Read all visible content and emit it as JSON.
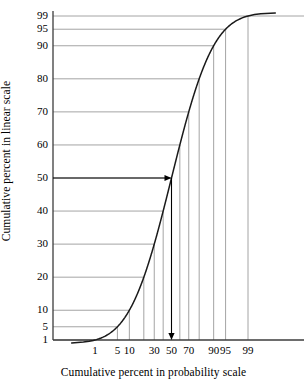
{
  "figure": {
    "x_axis_title": "Cumulative percent in probability scale",
    "y_axis_title": "Cumulative percent in linear scale"
  },
  "colors": {
    "curve": "#1a1a1a",
    "grid": "#9a9a9a",
    "axis": "#3c3c3c",
    "background": "#ffffff",
    "arrow": "#000000"
  },
  "chart_data": {
    "type": "line",
    "title": "",
    "subtitle": "",
    "xlabel": "Cumulative percent in probability scale",
    "ylabel": "Cumulative percent in linear scale",
    "xscale": "probability",
    "yscale": "linear",
    "xlim": [
      0.1,
      99.9
    ],
    "ylim": [
      1,
      99
    ],
    "grid": true,
    "grid_style": "construction-lines-from-axes-to-curve",
    "legend": "none",
    "xticks": [
      1,
      5,
      10,
      30,
      50,
      70,
      90,
      95,
      99
    ],
    "xtick_labels": [
      "1",
      "5",
      "10",
      "30",
      "50",
      "70",
      "90",
      "95",
      "99"
    ],
    "yticks": [
      1,
      5,
      10,
      20,
      30,
      40,
      50,
      60,
      70,
      80,
      90,
      95,
      99
    ],
    "ytick_labels": [
      "1",
      "5",
      "10",
      "20",
      "30",
      "40",
      "50",
      "60",
      "70",
      "80",
      "90",
      "95",
      "99"
    ],
    "vertical_gridlines_at_x": [
      1,
      5,
      10,
      20,
      30,
      40,
      50,
      60,
      70,
      80,
      90,
      95,
      99
    ],
    "horizontal_gridlines_at_y": [
      1,
      5,
      10,
      20,
      30,
      40,
      50,
      60,
      70,
      80,
      90,
      95,
      99
    ],
    "series": [
      {
        "name": "cumulative percent",
        "description": "Normal ogive: linear cumulative percent plotted against probability-scale cumulative percent",
        "x": [
          1,
          5,
          10,
          20,
          30,
          40,
          50,
          60,
          70,
          80,
          90,
          95,
          99
        ],
        "values": [
          1,
          5,
          10,
          20,
          30,
          40,
          50,
          60,
          70,
          80,
          90,
          95,
          99
        ]
      }
    ],
    "annotations": [
      {
        "type": "arrow",
        "direction": "right",
        "label": "",
        "from": {
          "x": 0.1,
          "y": 50
        },
        "to": {
          "x": 50,
          "y": 50
        },
        "note": "horizontal reference line from y axis at 50 to the curve"
      },
      {
        "type": "arrow",
        "direction": "down",
        "label": "",
        "from": {
          "x": 50,
          "y": 50
        },
        "to": {
          "x": 50,
          "y": 1
        },
        "note": "vertical reference line from the curve down to x axis at 50"
      }
    ]
  }
}
